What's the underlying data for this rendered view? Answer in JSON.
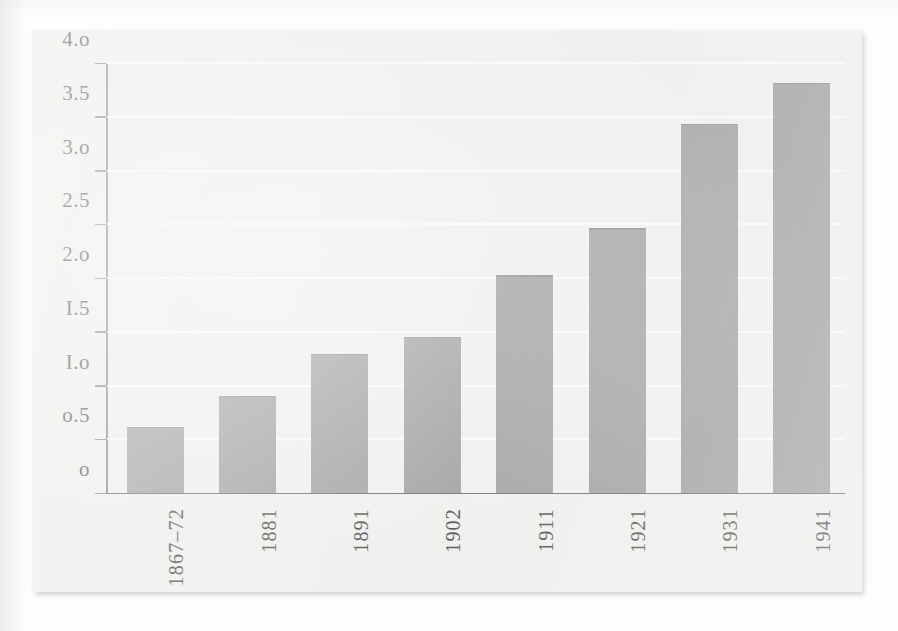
{
  "chart_data": {
    "type": "bar",
    "title": "",
    "subtitle": "",
    "xlabel": "",
    "ylabel": "",
    "categories": [
      "1867–72",
      "1881",
      "1891",
      "1902",
      "1911",
      "1921",
      "1931",
      "1941"
    ],
    "values": [
      0.61,
      0.9,
      1.29,
      1.45,
      2.02,
      2.46,
      3.43,
      3.81
    ],
    "series": [
      {
        "name": "",
        "values": [
          0.61,
          0.9,
          1.29,
          1.45,
          2.02,
          2.46,
          3.43,
          3.81
        ]
      }
    ],
    "ylim": [
      0,
      4.0
    ],
    "ytick_values": [
      0,
      0.5,
      1.0,
      1.5,
      2.0,
      2.5,
      3.0,
      3.5,
      4.0
    ],
    "ytick_labels": [
      "o",
      "o.5",
      "I.o",
      "I.5",
      "2.o",
      "2.5",
      "3.o",
      "3.5",
      "4.o"
    ],
    "grid": "horizontal",
    "gridline_color": "#ffffff",
    "legend": null,
    "legend_position": "none",
    "bar_color": "#8e8e8c",
    "axis_color": "#4f4f4d",
    "plate_background": "#f1f1ef",
    "page_background": "#fdfdfc",
    "text_color": "#2a2a28",
    "xtick_rotation": 90,
    "annotations": []
  }
}
